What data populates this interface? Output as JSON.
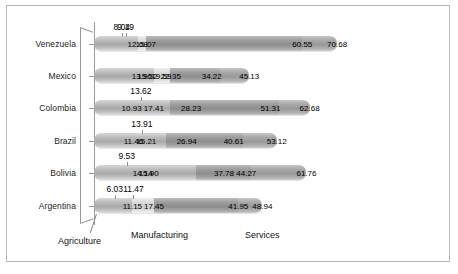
{
  "chart_data": {
    "type": "bar",
    "orientation": "horizontal",
    "stacked": true,
    "title": "",
    "subtitle": "",
    "xlabel": "",
    "ylabel": "",
    "grid": false,
    "legend_position": "below-axis",
    "xlim": [
      0,
      100
    ],
    "categories": [
      "Venezuela",
      "Mexico",
      "Colombia",
      "Brazil",
      "Bolivia",
      "Argentina"
    ],
    "group_labels": [
      "Agriculture",
      "Manufacturing",
      "Services"
    ],
    "series": [
      {
        "name": "Agriculture",
        "values": [
          12.68,
          22.35,
          28.23,
          26.94,
          44.27,
          11.15
        ]
      },
      {
        "name": "Manufacturing",
        "values": [
          15.07,
          13.9,
          17.41,
          15.21,
          15.9,
          17.45
        ]
      },
      {
        "name": "Services",
        "values": [
          60.55,
          19.59,
          10.93,
          11.46,
          14.14,
          41.95
        ]
      }
    ],
    "bars": [
      {
        "category": "Venezuela",
        "segments": [
          {
            "label": "12.68",
            "value": 12.68,
            "shade": "ag"
          },
          {
            "label": "15.07",
            "value": 15.07,
            "shade": "mf"
          },
          {
            "label": "60.55",
            "value": 60.55,
            "shade": "sv"
          },
          {
            "label": "70.68",
            "value": 70.68,
            "shade": "sv2"
          }
        ],
        "callouts": [
          {
            "label": "8.04",
            "value": 8.04
          },
          {
            "label": "9.19",
            "value": 9.19
          }
        ]
      },
      {
        "category": "Mexico",
        "segments": [
          {
            "label": "22.35",
            "value": 22.35,
            "shade": "ag"
          },
          {
            "label": "13.90",
            "value": 13.9,
            "shade": "mf"
          },
          {
            "label": "19.59",
            "value": 19.59,
            "shade": "mf"
          },
          {
            "label": "15.52",
            "value": 15.52,
            "shade": "mf"
          },
          {
            "label": "34.22",
            "value": 34.22,
            "shade": "sv"
          },
          {
            "label": "45.13",
            "value": 45.13,
            "shade": "sv2"
          }
        ],
        "callouts": []
      },
      {
        "category": "Colombia",
        "segments": [
          {
            "label": "28.23",
            "value": 28.23,
            "shade": "ag"
          },
          {
            "label": "17.41",
            "value": 17.41,
            "shade": "mf"
          },
          {
            "label": "10.93",
            "value": 10.93,
            "shade": "mf"
          },
          {
            "label": "51.31",
            "value": 51.31,
            "shade": "sv"
          },
          {
            "label": "62.68",
            "value": 62.68,
            "shade": "sv2"
          }
        ],
        "callouts": [
          {
            "label": "13.62",
            "value": 13.62
          }
        ]
      },
      {
        "category": "Brazil",
        "segments": [
          {
            "label": "26.94",
            "value": 26.94,
            "shade": "ag"
          },
          {
            "label": "15.21",
            "value": 15.21,
            "shade": "mf"
          },
          {
            "label": "11.46",
            "value": 11.46,
            "shade": "mf"
          },
          {
            "label": "40.61",
            "value": 40.61,
            "shade": "sv"
          },
          {
            "label": "53.12",
            "value": 53.12,
            "shade": "sv2"
          }
        ],
        "callouts": [
          {
            "label": "13.91",
            "value": 13.91
          }
        ]
      },
      {
        "category": "Bolivia",
        "segments": [
          {
            "label": "44.27",
            "value": 44.27,
            "shade": "ag"
          },
          {
            "label": "15.90",
            "value": 15.9,
            "shade": "mf"
          },
          {
            "label": "14.14",
            "value": 14.14,
            "shade": "mf"
          },
          {
            "label": "37.78",
            "value": 37.78,
            "shade": "sv"
          },
          {
            "label": "61.76",
            "value": 61.76,
            "shade": "sv2"
          }
        ],
        "callouts": [
          {
            "label": "9.53",
            "value": 9.53
          }
        ]
      },
      {
        "category": "Argentina",
        "segments": [
          {
            "label": "11.15",
            "value": 11.15,
            "shade": "ag"
          },
          {
            "label": "17.45",
            "value": 17.45,
            "shade": "mf"
          },
          {
            "label": "41.95",
            "value": 41.95,
            "shade": "sv"
          },
          {
            "label": "48.94",
            "value": 48.94,
            "shade": "sv2"
          }
        ],
        "callouts": [
          {
            "label": "6.03",
            "value": 6.03
          },
          {
            "label": "11.47",
            "value": 11.47
          }
        ]
      }
    ]
  },
  "axis": {
    "categories": [
      "Venezuela",
      "Mexico",
      "Colombia",
      "Brazil",
      "Bolivia",
      "Argentina"
    ]
  },
  "groups": {
    "agriculture": "Agriculture",
    "manufacturing": "Manufacturing",
    "services": "Services"
  }
}
